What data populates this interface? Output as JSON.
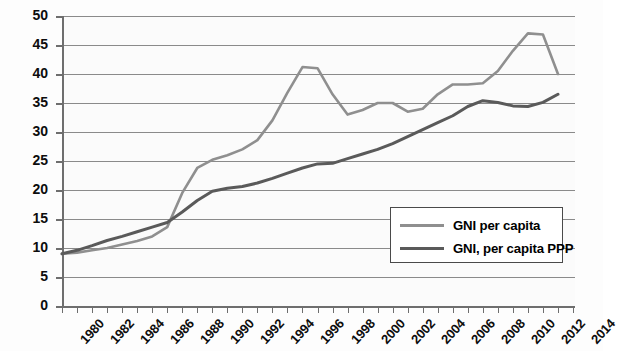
{
  "chart_data": {
    "type": "line",
    "title": "",
    "xlabel": "",
    "ylabel": "",
    "xlim": [
      1980,
      2014
    ],
    "ylim": [
      0,
      50
    ],
    "y_ticks": [
      0,
      5,
      10,
      15,
      20,
      25,
      30,
      35,
      40,
      45,
      50
    ],
    "x_ticks": [
      1980,
      1982,
      1984,
      1986,
      1988,
      1990,
      1992,
      1994,
      1996,
      1998,
      2000,
      2002,
      2004,
      2006,
      2008,
      2010,
      2012,
      2014
    ],
    "x_tick_labels": [
      "1980",
      "1982",
      "1984",
      "1986",
      "1988",
      "1990",
      "1992",
      "1994",
      "1996",
      "1998",
      "2000",
      "2002",
      "2004",
      "2006",
      "2008",
      "2010",
      "2012",
      "2014"
    ],
    "grid": "horizontal",
    "legend_position": "center-right",
    "x": [
      1980,
      1981,
      1982,
      1983,
      1984,
      1985,
      1986,
      1987,
      1988,
      1989,
      1990,
      1991,
      1992,
      1993,
      1994,
      1995,
      1996,
      1997,
      1998,
      1999,
      2000,
      2001,
      2002,
      2003,
      2004,
      2005,
      2006,
      2007,
      2008,
      2009,
      2010,
      2011,
      2012,
      2013
    ],
    "series": [
      {
        "name": "GNI per capita",
        "color": "#8f8f8f",
        "values": [
          9.0,
          9.2,
          9.6,
          10.0,
          10.6,
          11.2,
          12.0,
          13.6,
          19.5,
          23.8,
          25.2,
          26.0,
          27.0,
          28.6,
          32.0,
          36.8,
          41.2,
          41.0,
          36.5,
          33.0,
          33.8,
          35.0,
          35.0,
          33.5,
          34.0,
          36.5,
          38.2,
          38.2,
          38.4,
          40.5,
          44.0,
          47.0,
          46.8,
          40.0
        ]
      },
      {
        "name": "GNI, per capita PPP",
        "color": "#5a5a5a",
        "values": [
          9.0,
          9.6,
          10.4,
          11.3,
          12.0,
          12.8,
          13.6,
          14.4,
          16.2,
          18.2,
          19.8,
          20.3,
          20.6,
          21.2,
          22.0,
          22.9,
          23.8,
          24.5,
          24.6,
          25.4,
          26.2,
          27.0,
          28.0,
          29.2,
          30.4,
          31.6,
          32.8,
          34.4,
          35.4,
          35.1,
          34.5,
          34.4,
          35.1,
          36.5
        ]
      }
    ],
    "legend": [
      {
        "label": "GNI per capita",
        "color": "#8f8f8f"
      },
      {
        "label": "GNI, per capita PPP",
        "color": "#5a5a5a"
      }
    ]
  }
}
